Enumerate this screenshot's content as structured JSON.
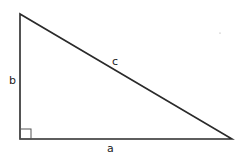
{
  "diagram": {
    "type": "right-triangle",
    "stroke_color": "#2a2a2a",
    "vertices": {
      "top": [
        20,
        14
      ],
      "right_angle": [
        20,
        139
      ],
      "right": [
        232,
        139
      ]
    },
    "labels": {
      "leg_vertical": "b",
      "hypotenuse": "c",
      "leg_horizontal": "a"
    },
    "right_angle_marker": true
  }
}
